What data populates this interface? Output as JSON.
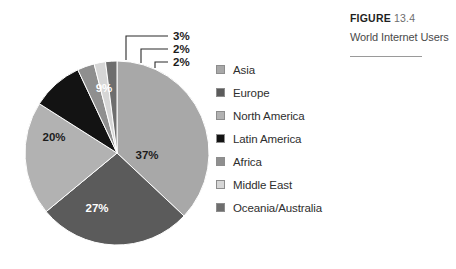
{
  "caption": {
    "figure_word": "FIGURE",
    "figure_number": "13.4",
    "title": "World Internet Users"
  },
  "legend": {
    "items": [
      {
        "label": "Asia",
        "color": "#a8a8a8"
      },
      {
        "label": "Europe",
        "color": "#5b5b5b"
      },
      {
        "label": "North America",
        "color": "#b2b2b2"
      },
      {
        "label": "Latin America",
        "color": "#131313"
      },
      {
        "label": "Africa",
        "color": "#8f8f8f"
      },
      {
        "label": "Middle East",
        "color": "#d6d6d6"
      },
      {
        "label": "Oceania/Australia",
        "color": "#6e6e6e"
      }
    ]
  },
  "chart_data": {
    "type": "pie",
    "title": "World Internet Users",
    "categories": [
      "Asia",
      "Europe",
      "North America",
      "Latin America",
      "Africa",
      "Middle East",
      "Oceania/Australia"
    ],
    "values": [
      37,
      27,
      20,
      9,
      3,
      2,
      2
    ],
    "value_labels": [
      "37%",
      "27%",
      "20%",
      "9%",
      "3%",
      "2%",
      "2%"
    ],
    "colors": [
      "#a8a8a8",
      "#5b5b5b",
      "#b2b2b2",
      "#131313",
      "#8f8f8f",
      "#d6d6d6",
      "#6e6e6e"
    ],
    "label_placement": [
      "inside",
      "inside",
      "inside",
      "inside",
      "callout",
      "callout",
      "callout"
    ],
    "label_text_color": [
      "dark",
      "light",
      "dark",
      "light",
      "dark",
      "dark",
      "dark"
    ],
    "start_angle_deg": 0,
    "direction": "clockwise",
    "legend_position": "right",
    "grid": false,
    "units": "percent"
  }
}
